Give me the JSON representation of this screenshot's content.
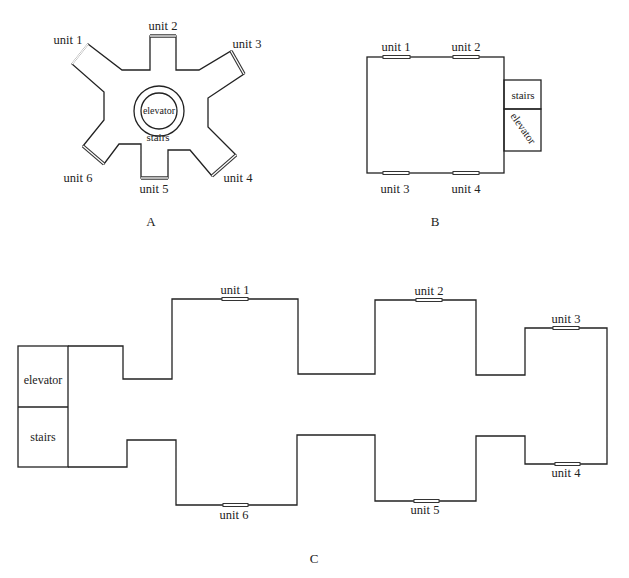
{
  "diagrams": {
    "A": {
      "caption": "A",
      "core": {
        "elevator": "elevator",
        "stairs": "stairs"
      },
      "units": [
        "unit 1",
        "unit 2",
        "unit 3",
        "unit 4",
        "unit 5",
        "unit 6"
      ]
    },
    "B": {
      "caption": "B",
      "core": {
        "stairs": "stairs",
        "elevator": "elevator"
      },
      "units": [
        "unit 1",
        "unit 2",
        "unit 3",
        "unit 4"
      ]
    },
    "C": {
      "caption": "C",
      "core": {
        "elevator": "elevator",
        "stairs": "stairs"
      },
      "units": [
        "unit 1",
        "unit 2",
        "unit 3",
        "unit 4",
        "unit 5",
        "unit 6"
      ]
    }
  },
  "colors": {
    "line": "#222222",
    "background": "#ffffff"
  }
}
